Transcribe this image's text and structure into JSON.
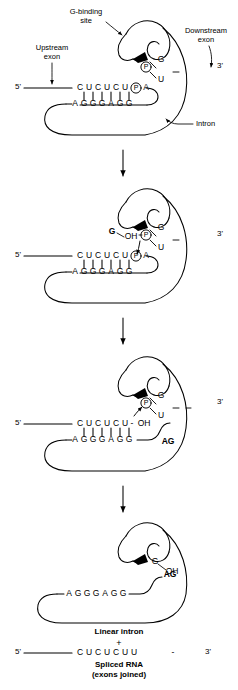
{
  "diagram": {
    "type": "biological-process-schematic",
    "stages": [
      {
        "id": "stage-1",
        "name": "G-binding and initial recognition",
        "annotations": [
          {
            "name": "g-binding-site-label",
            "text": "G-binding\nsite"
          },
          {
            "name": "upstream-exon-label",
            "text": "Upstream\nexon"
          },
          {
            "name": "downstream-exon-label",
            "text": "Downstream\nexon"
          },
          {
            "name": "intron-label",
            "text": "Intron"
          }
        ],
        "five_prime": "5'",
        "three_prime": "3'",
        "top_strand": [
          "C",
          "U",
          "C",
          "U",
          "C",
          "U"
        ],
        "phosphate": "P",
        "after_phosphate": "A",
        "bottom_strand": [
          "A",
          "G",
          "G",
          "G",
          "A",
          "G",
          "G"
        ],
        "pair_count": 6,
        "cofactor_g": "G",
        "cofactor_u": "U",
        "cofactor_phosphate": "P",
        "dash": "-"
      },
      {
        "id": "stage-2",
        "name": "Transesterification: free G attacks 5' splice site",
        "five_prime": "5'",
        "three_prime": "3'",
        "top_strand": [
          "C",
          "U",
          "C",
          "U",
          "C",
          "U"
        ],
        "phosphate": "P",
        "after_phosphate": "A",
        "bottom_strand": [
          "A",
          "G",
          "G",
          "G",
          "A",
          "G",
          "G"
        ],
        "pair_count": 6,
        "attacking_g": "G",
        "attacking_oh": "OH",
        "bound_phosphate": "P",
        "cofactor_g": "G",
        "cofactor_u": "U",
        "dash": "-"
      },
      {
        "id": "stage-3",
        "name": "5' exon released with free 3'-OH; intron 3' end is AG",
        "five_prime": "5'",
        "three_prime": "3'",
        "top_strand": [
          "C",
          "U",
          "C",
          "U",
          "C",
          "U"
        ],
        "terminal_oh": "OH",
        "bottom_strand": [
          "A",
          "G",
          "G",
          "G",
          "A",
          "G",
          "G"
        ],
        "pair_count": 6,
        "ag_label": "AG",
        "bound_phosphate": "P",
        "cofactor_g": "G",
        "cofactor_u": "U",
        "dash": "-"
      },
      {
        "id": "stage-4",
        "name": "Products: linear intron and spliced RNA",
        "cofactor_g": "G",
        "cofactor_oh": "OH",
        "ag_label": "AG",
        "bottom_strand": [
          "A",
          "G",
          "G",
          "G",
          "A",
          "G",
          "G"
        ],
        "product_intron_label": "Linear intron",
        "plus_sign": "+",
        "spliced_five_prime": "5'",
        "spliced_three_prime": "3'",
        "spliced_strand": [
          "C",
          "U",
          "C",
          "U",
          "C",
          "U",
          "U"
        ],
        "spliced_dash": "-",
        "product_rna_label": "Spliced RNA",
        "product_rna_sublabel": "(exons joined)"
      }
    ],
    "transition_arrows": 3,
    "colors": {
      "stroke": "#000000",
      "background": "#ffffff"
    }
  }
}
